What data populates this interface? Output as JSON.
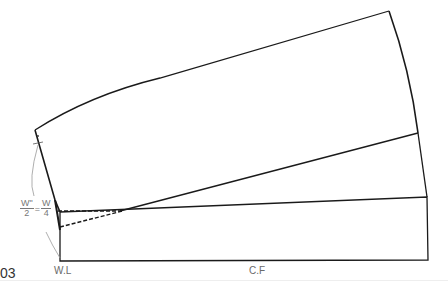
{
  "figure": {
    "number": "03",
    "labels": {
      "waist_line": "W.L",
      "center_front": "C.F"
    },
    "formula": {
      "left_num": "W\"",
      "left_den": "2",
      "equals": "=",
      "right_num": "W",
      "right_den": "4"
    },
    "colors": {
      "line": "#1a1a1a",
      "label": "#6a6a6a",
      "guide": "#999999"
    }
  }
}
